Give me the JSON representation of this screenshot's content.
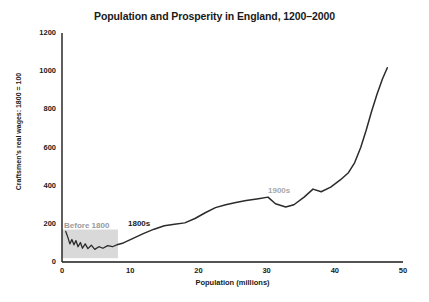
{
  "chart_data": {
    "type": "line",
    "title": "Population and Prosperity in England, 1200–2000",
    "xlabel": "Population (millions)",
    "ylabel": "Craftsmen's real wages: 1800 = 100",
    "xlim": [
      0,
      50
    ],
    "ylim": [
      0,
      1200
    ],
    "xticks": [
      0,
      10,
      20,
      30,
      40,
      50
    ],
    "yticks": [
      0,
      200,
      400,
      600,
      800,
      1000,
      1200
    ],
    "grid": false,
    "legend": "none",
    "annotations": [
      {
        "text": "Before 1800",
        "x": 1.2,
        "y": 250,
        "color": "#9a9a9a"
      },
      {
        "text": "1800s",
        "x": 10.2,
        "y": 265,
        "color": "#1a1a1a"
      },
      {
        "text": "1900s",
        "x": 30.8,
        "y": 415,
        "color": "#a8a8a8"
      }
    ],
    "inset_box": {
      "x0": 0,
      "x1": 8.2,
      "y0": 20,
      "y1": 170,
      "fill": "#d9d9d9"
    },
    "series": [
      {
        "name": "Before 1800 (inset squiggle)",
        "color": "#2b2b2b",
        "points": [
          [
            0.55,
            160
          ],
          [
            0.9,
            125
          ],
          [
            1.15,
            95
          ],
          [
            1.45,
            118
          ],
          [
            1.75,
            90
          ],
          [
            2.05,
            112
          ],
          [
            2.35,
            80
          ],
          [
            2.7,
            102
          ],
          [
            3.0,
            72
          ],
          [
            3.4,
            95
          ],
          [
            3.8,
            70
          ],
          [
            4.3,
            88
          ],
          [
            4.8,
            66
          ],
          [
            5.4,
            80
          ],
          [
            6.0,
            72
          ],
          [
            6.7,
            86
          ],
          [
            7.4,
            80
          ],
          [
            8.2,
            92
          ]
        ]
      },
      {
        "name": "Craftsmen's real wages vs population",
        "color": "#2b2b2b",
        "points": [
          [
            8.2,
            92
          ],
          [
            9.0,
            100
          ],
          [
            10.5,
            125
          ],
          [
            12.0,
            150
          ],
          [
            13.5,
            172
          ],
          [
            15.0,
            190
          ],
          [
            16.5,
            198
          ],
          [
            18.0,
            205
          ],
          [
            19.5,
            228
          ],
          [
            21.0,
            258
          ],
          [
            22.5,
            285
          ],
          [
            24.0,
            300
          ],
          [
            25.5,
            312
          ],
          [
            27.0,
            322
          ],
          [
            28.8,
            332
          ],
          [
            30.2,
            340
          ],
          [
            31.3,
            305
          ],
          [
            32.8,
            288
          ],
          [
            34.0,
            300
          ],
          [
            35.5,
            340
          ],
          [
            36.8,
            382
          ],
          [
            38.0,
            368
          ],
          [
            39.4,
            392
          ],
          [
            40.8,
            430
          ],
          [
            42.0,
            468
          ],
          [
            42.9,
            520
          ],
          [
            43.8,
            600
          ],
          [
            44.6,
            690
          ],
          [
            45.4,
            790
          ],
          [
            46.2,
            880
          ],
          [
            47.0,
            960
          ],
          [
            47.7,
            1018
          ]
        ]
      }
    ]
  }
}
